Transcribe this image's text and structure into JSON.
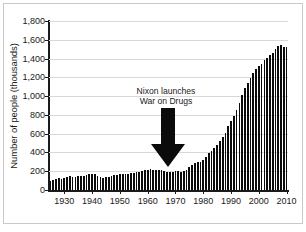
{
  "chart_data": {
    "type": "bar",
    "title": "",
    "subtitle": "",
    "xlabel": "",
    "ylabel": "Number of people (thousands)",
    "ylim": [
      0,
      1800
    ],
    "xlim": [
      1924,
      2011
    ],
    "grid": true,
    "legend": false,
    "y_ticks": [
      "0",
      "200",
      "400",
      "600",
      "800",
      "1,000",
      "1,200",
      "1,400",
      "1,600",
      "1,800"
    ],
    "y_tick_values": [
      0,
      200,
      400,
      600,
      800,
      1000,
      1200,
      1400,
      1600,
      1800
    ],
    "x_ticks": [
      "1930",
      "1940",
      "1950",
      "1960",
      "1970",
      "1980",
      "1990",
      "2000",
      "2010"
    ],
    "x_tick_values": [
      1930,
      1940,
      1950,
      1960,
      1970,
      1980,
      1990,
      2000,
      2010
    ],
    "bar_color": "#0b0b0b",
    "grid_color": "#d8d8d8",
    "axis_color": "#1a1a1a",
    "annotations": [
      {
        "text_line_1": "Nixon launches",
        "text_line_2": "War on Drugs",
        "points_to_year": 1971,
        "arrow": "down-arrow"
      }
    ],
    "categories": [
      1925,
      1926,
      1927,
      1928,
      1929,
      1930,
      1931,
      1932,
      1933,
      1934,
      1935,
      1936,
      1937,
      1938,
      1939,
      1940,
      1941,
      1942,
      1943,
      1944,
      1945,
      1946,
      1947,
      1948,
      1949,
      1950,
      1951,
      1952,
      1953,
      1954,
      1955,
      1956,
      1957,
      1958,
      1959,
      1960,
      1961,
      1962,
      1963,
      1964,
      1965,
      1966,
      1967,
      1968,
      1969,
      1970,
      1971,
      1972,
      1973,
      1974,
      1975,
      1976,
      1977,
      1978,
      1979,
      1980,
      1981,
      1982,
      1983,
      1984,
      1985,
      1986,
      1987,
      1988,
      1989,
      1990,
      1991,
      1992,
      1993,
      1994,
      1995,
      1996,
      1997,
      1998,
      1999,
      2000,
      2001,
      2002,
      2003,
      2004,
      2005,
      2006,
      2007,
      2008,
      2009,
      2010
    ],
    "values": [
      92,
      110,
      120,
      125,
      122,
      130,
      140,
      145,
      137,
      138,
      145,
      146,
      152,
      160,
      170,
      174,
      166,
      150,
      138,
      133,
      134,
      141,
      152,
      155,
      163,
      166,
      166,
      169,
      173,
      182,
      186,
      189,
      195,
      206,
      208,
      213,
      220,
      218,
      217,
      214,
      210,
      200,
      195,
      188,
      197,
      198,
      199,
      196,
      204,
      218,
      241,
      263,
      285,
      295,
      301,
      316,
      353,
      395,
      419,
      445,
      481,
      523,
      560,
      603,
      680,
      740,
      790,
      847,
      932,
      1016,
      1085,
      1138,
      1197,
      1246,
      1287,
      1316,
      1345,
      1380,
      1409,
      1433,
      1462,
      1504,
      1532,
      1540,
      1524,
      1518
    ]
  }
}
